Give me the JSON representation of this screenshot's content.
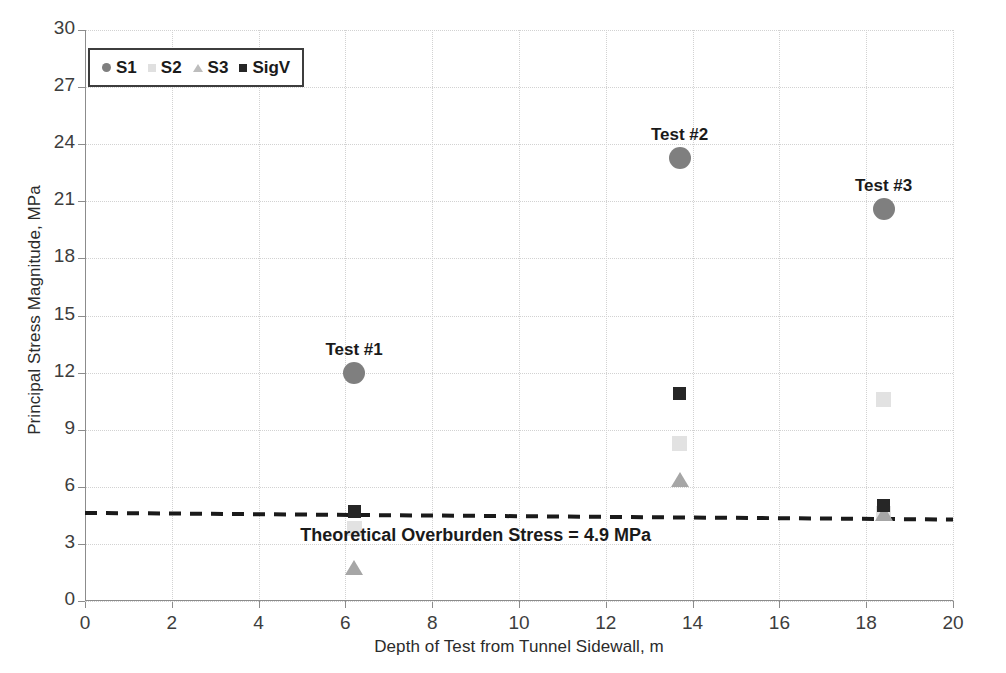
{
  "chart_data": {
    "type": "scatter",
    "title": "",
    "xlabel": "Depth of Test from Tunnel Sidewall, m",
    "ylabel": "Principal Stress Magnitude, MPa",
    "xlim": [
      0,
      20
    ],
    "ylim": [
      0,
      30
    ],
    "xticks": [
      0,
      2,
      4,
      6,
      8,
      10,
      12,
      14,
      16,
      18,
      20
    ],
    "yticks": [
      0,
      3,
      6,
      9,
      12,
      15,
      18,
      21,
      24,
      27,
      30
    ],
    "grid": true,
    "legend_position": "top-left",
    "legend_entries": [
      {
        "name": "S1",
        "marker": "circle",
        "color": "#7f7f7f"
      },
      {
        "name": "S2",
        "marker": "square",
        "color": "#e2e2e2"
      },
      {
        "name": "S3",
        "marker": "triangle",
        "color": "#a6a6a6"
      },
      {
        "name": "SigV",
        "marker": "square",
        "color": "#262626"
      }
    ],
    "series": [
      {
        "name": "S1",
        "marker": "circle",
        "color": "#7f7f7f",
        "points": [
          {
            "x": 6.2,
            "y": 12.0
          },
          {
            "x": 13.7,
            "y": 23.3
          },
          {
            "x": 18.4,
            "y": 20.6
          }
        ]
      },
      {
        "name": "S2",
        "marker": "square",
        "color": "#e2e2e2",
        "points": [
          {
            "x": 6.2,
            "y": 3.8
          },
          {
            "x": 13.7,
            "y": 8.3
          },
          {
            "x": 18.4,
            "y": 10.6
          },
          {
            "x": 18.4,
            "y": 4.6
          }
        ]
      },
      {
        "name": "S3",
        "marker": "triangle",
        "color": "#a6a6a6",
        "points": [
          {
            "x": 6.2,
            "y": 1.7
          },
          {
            "x": 13.7,
            "y": 6.3
          },
          {
            "x": 18.4,
            "y": 4.5
          }
        ]
      },
      {
        "name": "SigV",
        "marker": "square",
        "color": "#262626",
        "points": [
          {
            "x": 6.2,
            "y": 4.7
          },
          {
            "x": 13.7,
            "y": 10.9
          },
          {
            "x": 18.4,
            "y": 5.0
          }
        ]
      }
    ],
    "point_labels": [
      {
        "text": "Test #1",
        "x": 6.2,
        "y": 13.1
      },
      {
        "text": "Test #2",
        "x": 13.7,
        "y": 24.4
      },
      {
        "text": "Test #3",
        "x": 18.4,
        "y": 21.7
      }
    ],
    "reference_line": {
      "label": "Theoretical Overburden Stress = 4.9 MPa",
      "value": 4.9,
      "style": "dashed",
      "color": "#1a1a1a",
      "y_start": 4.63,
      "y_end": 4.28,
      "label_x": 9.0,
      "label_y": 3.35
    }
  }
}
